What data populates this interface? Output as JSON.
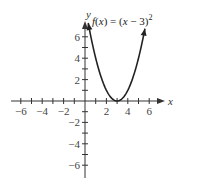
{
  "chart_data": {
    "type": "line",
    "title": "",
    "function_label": "f(x) = (x − 3)",
    "function_exponent": "2",
    "xlabel": "x",
    "ylabel": "y",
    "xlim": [
      -7,
      7
    ],
    "ylim": [
      -7,
      7
    ],
    "x_ticks": [
      -6,
      -4,
      -2,
      2,
      4,
      6
    ],
    "y_ticks": [
      6,
      4,
      2,
      -2,
      -4,
      -6
    ],
    "x_tick_labels": [
      "−6",
      "−4",
      "−2",
      "2",
      "4",
      "6"
    ],
    "y_tick_labels": [
      "6",
      "4",
      "2",
      "−2",
      "−4",
      "−6"
    ],
    "series": [
      {
        "name": "f(x) = (x − 3)^2",
        "vertex": [
          3,
          0
        ],
        "x_range": [
          0.3,
          5.6
        ],
        "x": [
          0.3,
          1,
          2,
          3,
          4,
          5,
          5.6
        ],
        "values": [
          7.29,
          4,
          1,
          0,
          1,
          4,
          6.76
        ]
      }
    ],
    "grid": false,
    "arrows": true
  },
  "top_text_fragment": ""
}
